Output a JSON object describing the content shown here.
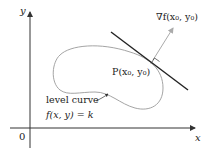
{
  "diagram": {
    "axes": {
      "x_label": "x",
      "y_label": "y",
      "origin_label": "0"
    },
    "gradient_label": "∇f(x₀, y₀)",
    "point_label": "P(x₀, y₀)",
    "curve_label_line1": "level curve",
    "curve_label_line2": "f(x, y) = k",
    "colors": {
      "axes": "#333333",
      "tangent_line": "#222222",
      "curve": "#9a9a9a",
      "gradient_arrow": "#a8a8a8"
    }
  }
}
